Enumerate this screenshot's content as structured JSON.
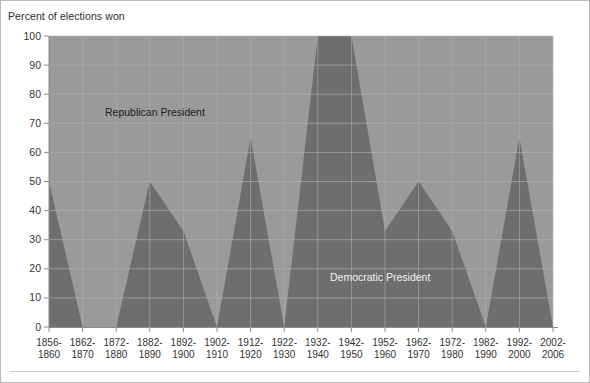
{
  "figure": {
    "axis_title": "Percent of elections won",
    "background_color": "#ffffff",
    "border_color": "#b9b9b9"
  },
  "colors": {
    "republican_area": "#9a9a9a",
    "democratic_area": "#6e6e6e",
    "plot_top_band": "#8f8f8f",
    "gridline": "#b5b5b5",
    "axis_line": "#8c8c8c",
    "tick_color": "#8c8c8c",
    "republican_label_text": "#1c1c1c",
    "democratic_label_text": "#f2f2f2"
  },
  "labels": {
    "republican": "Republican President",
    "democratic": "Democratic President"
  },
  "chart_data": {
    "type": "area",
    "title": "",
    "subtitle": "",
    "xlabel": "",
    "ylabel": "Percent of elections won",
    "ylim": [
      0,
      100
    ],
    "ytick_values": [
      0,
      10,
      20,
      30,
      40,
      50,
      60,
      70,
      80,
      90,
      100
    ],
    "ytick_labels": [
      "0",
      "10",
      "20",
      "30",
      "40",
      "50",
      "60",
      "70",
      "80",
      "90",
      "100"
    ],
    "grid": true,
    "legend_position": "in-plot-annotations",
    "stacked_total": 100,
    "categories": [
      "1856-\n1860",
      "1862-\n1870",
      "1872-\n1880",
      "1882-\n1890",
      "1892-\n1900",
      "1902-\n1910",
      "1912-\n1920",
      "1922-\n1930",
      "1932-\n1940",
      "1942-\n1950",
      "1952-\n1960",
      "1962-\n1970",
      "1972-\n1980",
      "1982-\n1990",
      "1992-\n2000",
      "2002-\n2006"
    ],
    "categories_line1": [
      "1856-",
      "1862-",
      "1872-",
      "1882-",
      "1892-",
      "1902-",
      "1912-",
      "1922-",
      "1932-",
      "1942-",
      "1952-",
      "1962-",
      "1972-",
      "1982-",
      "1992-",
      "2002-"
    ],
    "categories_line2": [
      "1860",
      "1870",
      "1880",
      "1890",
      "1900",
      "1910",
      "1920",
      "1930",
      "1940",
      "1950",
      "1960",
      "1970",
      "1980",
      "1990",
      "2000",
      "2006"
    ],
    "series": [
      {
        "name": "Democratic President",
        "color": "#6e6e6e",
        "values": [
          50,
          0,
          0,
          50,
          33,
          0,
          65,
          0,
          100,
          100,
          33,
          50,
          33,
          0,
          65,
          0
        ]
      },
      {
        "name": "Republican President",
        "color": "#9a9a9a",
        "values": [
          50,
          100,
          100,
          50,
          67,
          100,
          35,
          100,
          0,
          0,
          67,
          50,
          67,
          100,
          35,
          100
        ]
      }
    ]
  }
}
